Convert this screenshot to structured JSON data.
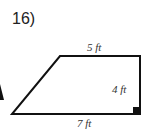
{
  "problem": {
    "number": "16)"
  },
  "figure": {
    "shape": "right trapezoid",
    "labels": {
      "top": "5 ft",
      "right": "4 ft",
      "bottom": "7 ft"
    },
    "right_angle_marker": "bottom-right",
    "stroke_color": "#111111"
  }
}
